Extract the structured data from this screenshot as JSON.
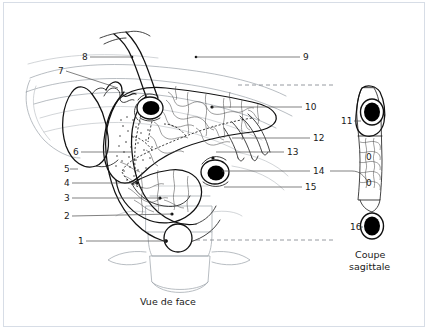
{
  "figure": {
    "title_front": "Vue de face",
    "title_sagittal_line1": "Coupe",
    "title_sagittal_line2": "sagittale",
    "style": {
      "ink": "#111111",
      "faint_ink": "#9aa0a8",
      "leader": "#4a4a4a",
      "vessel_lumen": "#000000",
      "background": "#ffffff",
      "frame_border": "#d7dde6"
    }
  },
  "labels_left": [
    {
      "id": "8",
      "text": "8",
      "x": 82,
      "y": 60,
      "lx1": 90,
      "ly1": 57,
      "lx2": 132,
      "ly2": 57
    },
    {
      "id": "7",
      "text": "7",
      "x": 58,
      "y": 74,
      "lx1": 66,
      "ly1": 71,
      "lx2": 118,
      "ly2": 88
    },
    {
      "id": "6",
      "text": "6",
      "x": 73,
      "y": 155,
      "lx1": 81,
      "ly1": 152,
      "lx2": 133,
      "ly2": 152
    },
    {
      "id": "5",
      "text": "5",
      "x": 64,
      "y": 172,
      "lx1": 0,
      "ly1": 0,
      "lx2": 0,
      "ly2": 0
    },
    {
      "id": "4",
      "text": "4",
      "x": 64,
      "y": 186,
      "lx1": 72,
      "ly1": 183,
      "lx2": 137,
      "ly2": 183
    },
    {
      "id": "3",
      "text": "3",
      "x": 64,
      "y": 201,
      "lx1": 72,
      "ly1": 198,
      "lx2": 160,
      "ly2": 198
    },
    {
      "id": "2",
      "text": "2",
      "x": 64,
      "y": 219,
      "lx1": 72,
      "ly1": 216,
      "lx2": 172,
      "ly2": 214
    },
    {
      "id": "1",
      "text": "1",
      "x": 78,
      "y": 244,
      "lx1": 86,
      "ly1": 241,
      "lx2": 166,
      "ly2": 241
    }
  ],
  "labels_right": [
    {
      "id": "9",
      "text": "9",
      "x": 303,
      "y": 60,
      "lx1": 300,
      "ly1": 57,
      "lx2": 196,
      "ly2": 57
    },
    {
      "id": "10",
      "text": "10",
      "x": 305,
      "y": 110,
      "lx1": 302,
      "ly1": 107,
      "lx2": 212,
      "ly2": 107
    },
    {
      "id": "12",
      "text": "12",
      "x": 313,
      "y": 141,
      "lx1": 310,
      "ly1": 138,
      "lx2": 232,
      "ly2": 138
    },
    {
      "id": "13",
      "text": "13",
      "x": 287,
      "y": 155,
      "lx1": 284,
      "ly1": 152,
      "lx2": 216,
      "ly2": 152
    },
    {
      "id": "14",
      "text": "14",
      "x": 313,
      "y": 174,
      "lx1": 310,
      "ly1": 171,
      "lx2": 222,
      "ly2": 171
    },
    {
      "id": "15",
      "text": "15",
      "x": 305,
      "y": 190,
      "lx1": 302,
      "ly1": 187,
      "lx2": 224,
      "ly2": 187
    }
  ],
  "labels_sagittal": [
    {
      "id": "11",
      "text": "11",
      "x": 343,
      "y": 124,
      "lx1": 354,
      "ly1": 121,
      "lx2": 379,
      "ly2": 121
    },
    {
      "id": "16",
      "text": "16",
      "x": 352,
      "y": 230,
      "lx1": 363,
      "ly1": 227,
      "lx2": 379,
      "ly2": 227
    }
  ],
  "annotations": {
    "lobule_marks": [
      "0",
      "0"
    ]
  }
}
